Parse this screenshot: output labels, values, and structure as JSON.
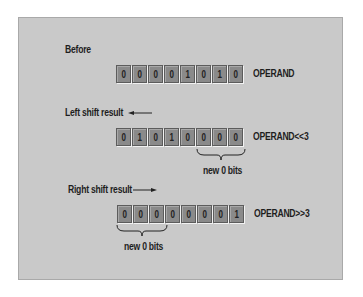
{
  "diagram": {
    "type": "bit-shift-illustration",
    "colors": {
      "background": "#c9c9c9",
      "bit_fill": "#8a8a8a",
      "bit_border": "#5c5c5c",
      "text": "#1e1e1e"
    },
    "before": {
      "heading": "Before",
      "bits": [
        "0",
        "0",
        "0",
        "0",
        "1",
        "0",
        "1",
        "0"
      ],
      "name": "OPERAND"
    },
    "left_shift": {
      "heading": "Left shift result",
      "arrow_direction": "left",
      "bits": [
        "0",
        "1",
        "0",
        "1",
        "0",
        "0",
        "0",
        "0"
      ],
      "name": "OPERAND<<3",
      "brace_label": "new 0 bits",
      "brace_spans_bits": [
        5,
        7
      ]
    },
    "right_shift": {
      "heading": "Right shift result",
      "arrow_direction": "right",
      "bits": [
        "0",
        "0",
        "0",
        "0",
        "0",
        "0",
        "0",
        "1"
      ],
      "name": "OPERAND>>3",
      "brace_label": "new 0 bits",
      "brace_spans_bits": [
        0,
        2
      ]
    }
  }
}
